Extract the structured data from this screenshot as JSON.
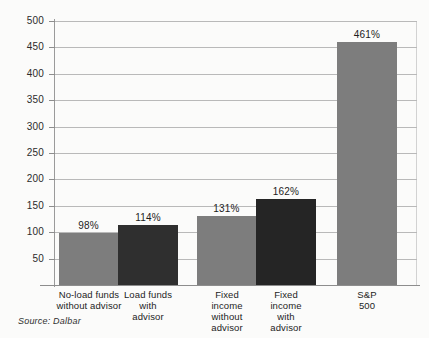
{
  "chart_data": {
    "type": "bar",
    "title": "",
    "subtitle": "",
    "xlabel": "",
    "ylabel": "",
    "ylim": [
      0,
      500
    ],
    "yticks": [
      50,
      100,
      150,
      200,
      250,
      300,
      350,
      400,
      450,
      500
    ],
    "grid": true,
    "legend": null,
    "categories": [
      "No-load funds\nwithout advisor",
      "Load funds\nwith\nadvisor",
      "Fixed\nincome\nwithout\nadvisor",
      "Fixed\nincome\nwith\nadvisor",
      "S&P\n500"
    ],
    "values": [
      98,
      114,
      131,
      162,
      461
    ],
    "data_labels": [
      "98%",
      "114%",
      "131%",
      "162%",
      "461%"
    ],
    "bar_colors": [
      "#7d7d7d",
      "#2f2f2f",
      "#7d7d7d",
      "#252525",
      "#7d7d7d"
    ],
    "source": "Source: Dalbar"
  },
  "axis": {
    "ticks": [
      {
        "label": "500",
        "value": 500
      },
      {
        "label": "450",
        "value": 450
      },
      {
        "label": "400",
        "value": 400
      },
      {
        "label": "350",
        "value": 350
      },
      {
        "label": "300",
        "value": 300
      },
      {
        "label": "250",
        "value": 250
      },
      {
        "label": "200",
        "value": 200
      },
      {
        "label": "150",
        "value": 150
      },
      {
        "label": "100",
        "value": 100
      },
      {
        "label": "50",
        "value": 50
      }
    ]
  },
  "categories": [
    {
      "lines": [
        "No-load funds",
        "without advisor"
      ],
      "value_label": "98%"
    },
    {
      "lines": [
        "Load funds",
        "with",
        "advisor"
      ],
      "value_label": "114%"
    },
    {
      "lines": [
        "Fixed",
        "income",
        "without",
        "advisor"
      ],
      "value_label": "131%"
    },
    {
      "lines": [
        "Fixed",
        "income",
        "with",
        "advisor"
      ],
      "value_label": "162%"
    },
    {
      "lines": [
        "S&P",
        "500"
      ],
      "value_label": "461%"
    }
  ],
  "footer": {
    "source": "Source: Dalbar"
  },
  "colors": {
    "bar_light": "#7d7d7d",
    "bar_dark": "#2f2f2f",
    "gridline": "#b9b9b9",
    "axis": "#8d8d8d",
    "text": "#1d1d1d",
    "background": "#fbfbfa"
  }
}
